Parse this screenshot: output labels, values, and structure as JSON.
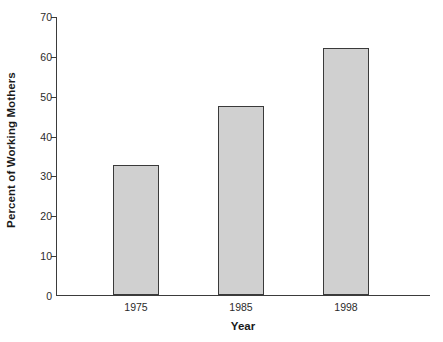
{
  "chart_data": {
    "type": "bar",
    "title": "",
    "subtitle": "",
    "xlabel": "Year",
    "ylabel": "Percent of Working Mothers",
    "categories": [
      "1975",
      "1985",
      "1998"
    ],
    "values": [
      32.5,
      47.5,
      62
    ],
    "series": [
      {
        "name": "Percent of Working Mothers",
        "values": [
          32.5,
          47.5,
          62
        ]
      }
    ],
    "ylim": [
      0,
      70
    ],
    "xlim": [
      0,
      3
    ],
    "y_ticks": [
      0,
      10,
      20,
      30,
      40,
      50,
      60,
      70
    ],
    "y_tick_labels": [
      "0",
      "10",
      "20",
      "30",
      "40",
      "50",
      "60",
      "70"
    ],
    "x_tick_labels": [
      "1975",
      "1985",
      "1998"
    ],
    "grid": false,
    "legend": false,
    "legend_position": "none",
    "bar_fill_color": "#d0d0d0",
    "bar_edge_color": "#3a3a3a",
    "axis_color": "#3b3b3b",
    "background_color": "#ffffff",
    "annotations": []
  },
  "axes": {
    "y_title": "Percent of Working Mothers",
    "x_title": "Year"
  }
}
